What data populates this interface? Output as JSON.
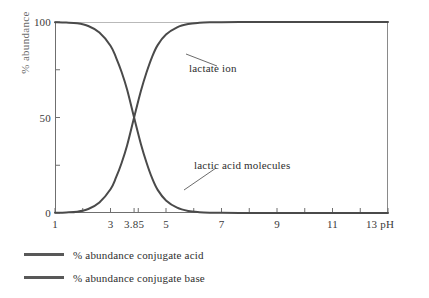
{
  "chart_data": {
    "type": "line",
    "title": "",
    "xlabel": "pH",
    "ylabel": "% abundance",
    "xlim": [
      1,
      13
    ],
    "ylim": [
      0,
      100
    ],
    "grid": false,
    "legend_position": "below-plot-left",
    "pka": 3.85,
    "x_tick_labels": [
      "1",
      "3",
      "3.85",
      "5",
      "7",
      "9",
      "11",
      "13 pH"
    ],
    "x_tick_values": [
      1,
      3,
      3.85,
      5,
      7,
      9,
      11,
      13
    ],
    "x_minor_tick_values": [
      2,
      4,
      6,
      8,
      10,
      12
    ],
    "y_tick_labels": [
      "100",
      "50",
      "0"
    ],
    "y_tick_values": [
      100,
      50,
      0
    ],
    "y_minor_tick_values": [
      75,
      25
    ],
    "series": [
      {
        "name": "% abundance conjugate acid",
        "annotation": "lactic acid molecules",
        "color": "#4a4a4a",
        "x": [
          1,
          1.4,
          1.8,
          2.2,
          2.6,
          3.0,
          3.2,
          3.4,
          3.6,
          3.85,
          4.1,
          4.3,
          4.5,
          4.7,
          5.0,
          5.4,
          5.8,
          6.2,
          6.6,
          7.0,
          8.0,
          9.0,
          10.0,
          11.0,
          12.0,
          13.0
        ],
        "values": [
          99.9,
          99.7,
          99.3,
          97.9,
          94.5,
          87.6,
          81.4,
          73.8,
          64.5,
          50.0,
          35.9,
          26.3,
          18.2,
          12.1,
          6.6,
          2.8,
          1.1,
          0.45,
          0.18,
          0.07,
          0.007,
          0.0007,
          0.0,
          0.0,
          0.0,
          0.0
        ]
      },
      {
        "name": "% abundance conjugate base",
        "annotation": "lactate ion",
        "color": "#4a4a4a",
        "x": [
          1,
          1.4,
          1.8,
          2.2,
          2.6,
          3.0,
          3.2,
          3.4,
          3.6,
          3.85,
          4.1,
          4.3,
          4.5,
          4.7,
          5.0,
          5.4,
          5.8,
          6.2,
          6.6,
          7.0,
          8.0,
          9.0,
          10.0,
          11.0,
          12.0,
          13.0
        ],
        "values": [
          0.1,
          0.3,
          0.7,
          2.1,
          5.5,
          12.4,
          18.6,
          26.2,
          35.5,
          50.0,
          64.1,
          73.7,
          81.8,
          87.9,
          93.4,
          97.2,
          98.9,
          99.55,
          99.82,
          99.93,
          99.993,
          99.999,
          100,
          100,
          100,
          100
        ]
      }
    ],
    "annotations": [
      {
        "text": "lactate ion",
        "target_series": "% abundance conjugate base"
      },
      {
        "text": "lactic acid molecules",
        "target_series": "% abundance conjugate acid"
      }
    ],
    "legend": [
      {
        "label": "% abundance conjugate acid",
        "color": "#585858"
      },
      {
        "label": "% abundance conjugate base",
        "color": "#585858"
      }
    ]
  },
  "axes": {
    "y_title": "% abundance",
    "y_ticks": [
      {
        "label": "100",
        "value": 100
      },
      {
        "label": "50",
        "value": 50
      },
      {
        "label": "0",
        "value": 0
      }
    ],
    "x_ticks": [
      {
        "label": "1",
        "value": 1
      },
      {
        "label": "3",
        "value": 3
      },
      {
        "label": "3.85",
        "value": 3.85
      },
      {
        "label": "5",
        "value": 5
      },
      {
        "label": "7",
        "value": 7
      },
      {
        "label": "9",
        "value": 9
      },
      {
        "label": "11",
        "value": 11
      },
      {
        "label": "13 pH",
        "value": 13
      }
    ]
  },
  "annotations": {
    "lactate_ion": "lactate ion",
    "lactic_acid": "lactic acid molecules"
  },
  "legend": {
    "items": [
      {
        "label": "% abundance conjugate acid"
      },
      {
        "label": "% abundance conjugate base"
      }
    ]
  },
  "colors": {
    "curve": "#4a4a4a",
    "legend_swatch": "#585858",
    "axis": "#6f6f6f",
    "text": "#2e2e2e",
    "axis_title": "#6a6a6a"
  }
}
